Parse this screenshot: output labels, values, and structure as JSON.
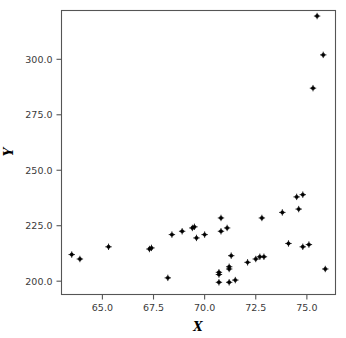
{
  "chart_data": {
    "type": "scatter",
    "title": "",
    "xlabel": "X",
    "ylabel": "Y",
    "xlim": [
      63.0,
      76.4
    ],
    "ylim": [
      194.0,
      322.0
    ],
    "grid": false,
    "legend": null,
    "marker": "plus-dot",
    "marker_color": "#000000",
    "xticks": [
      65.0,
      67.5,
      70.0,
      72.5,
      75.0
    ],
    "xticklabels": [
      "65.0",
      "67.5",
      "70.0",
      "72.5",
      "75.0"
    ],
    "yticks": [
      200.0,
      225.0,
      250.0,
      275.0,
      300.0
    ],
    "yticklabels": [
      "200.0",
      "225.0",
      "250.0",
      "275.0",
      "300.0"
    ],
    "n_points": 46,
    "points": [
      {
        "x": 63.5,
        "y": 212.0
      },
      {
        "x": 63.9,
        "y": 210.0
      },
      {
        "x": 65.3,
        "y": 215.5
      },
      {
        "x": 67.3,
        "y": 214.5
      },
      {
        "x": 67.4,
        "y": 215.0
      },
      {
        "x": 68.2,
        "y": 201.5
      },
      {
        "x": 68.4,
        "y": 221.0
      },
      {
        "x": 68.9,
        "y": 222.5
      },
      {
        "x": 69.4,
        "y": 224.0
      },
      {
        "x": 69.5,
        "y": 224.5
      },
      {
        "x": 69.6,
        "y": 219.5
      },
      {
        "x": 70.0,
        "y": 221.0
      },
      {
        "x": 70.7,
        "y": 204.0
      },
      {
        "x": 70.7,
        "y": 203.0
      },
      {
        "x": 70.7,
        "y": 199.5
      },
      {
        "x": 70.8,
        "y": 228.5
      },
      {
        "x": 70.8,
        "y": 222.5
      },
      {
        "x": 71.1,
        "y": 224.0
      },
      {
        "x": 71.2,
        "y": 205.5
      },
      {
        "x": 71.2,
        "y": 206.5
      },
      {
        "x": 71.2,
        "y": 199.5
      },
      {
        "x": 71.3,
        "y": 211.5
      },
      {
        "x": 71.5,
        "y": 200.5
      },
      {
        "x": 72.1,
        "y": 208.5
      },
      {
        "x": 72.5,
        "y": 210.0
      },
      {
        "x": 72.7,
        "y": 211.0
      },
      {
        "x": 72.8,
        "y": 228.5
      },
      {
        "x": 72.9,
        "y": 211.0
      },
      {
        "x": 73.8,
        "y": 231.0
      },
      {
        "x": 74.1,
        "y": 217.0
      },
      {
        "x": 74.5,
        "y": 238.0
      },
      {
        "x": 74.6,
        "y": 232.5
      },
      {
        "x": 74.8,
        "y": 239.0
      },
      {
        "x": 74.8,
        "y": 215.5
      },
      {
        "x": 75.1,
        "y": 216.5
      },
      {
        "x": 75.3,
        "y": 287.0
      },
      {
        "x": 75.5,
        "y": 319.5
      },
      {
        "x": 75.8,
        "y": 302.0
      },
      {
        "x": 75.9,
        "y": 205.5
      }
    ]
  },
  "axes": {
    "x_title": "X",
    "y_title": "Y"
  }
}
